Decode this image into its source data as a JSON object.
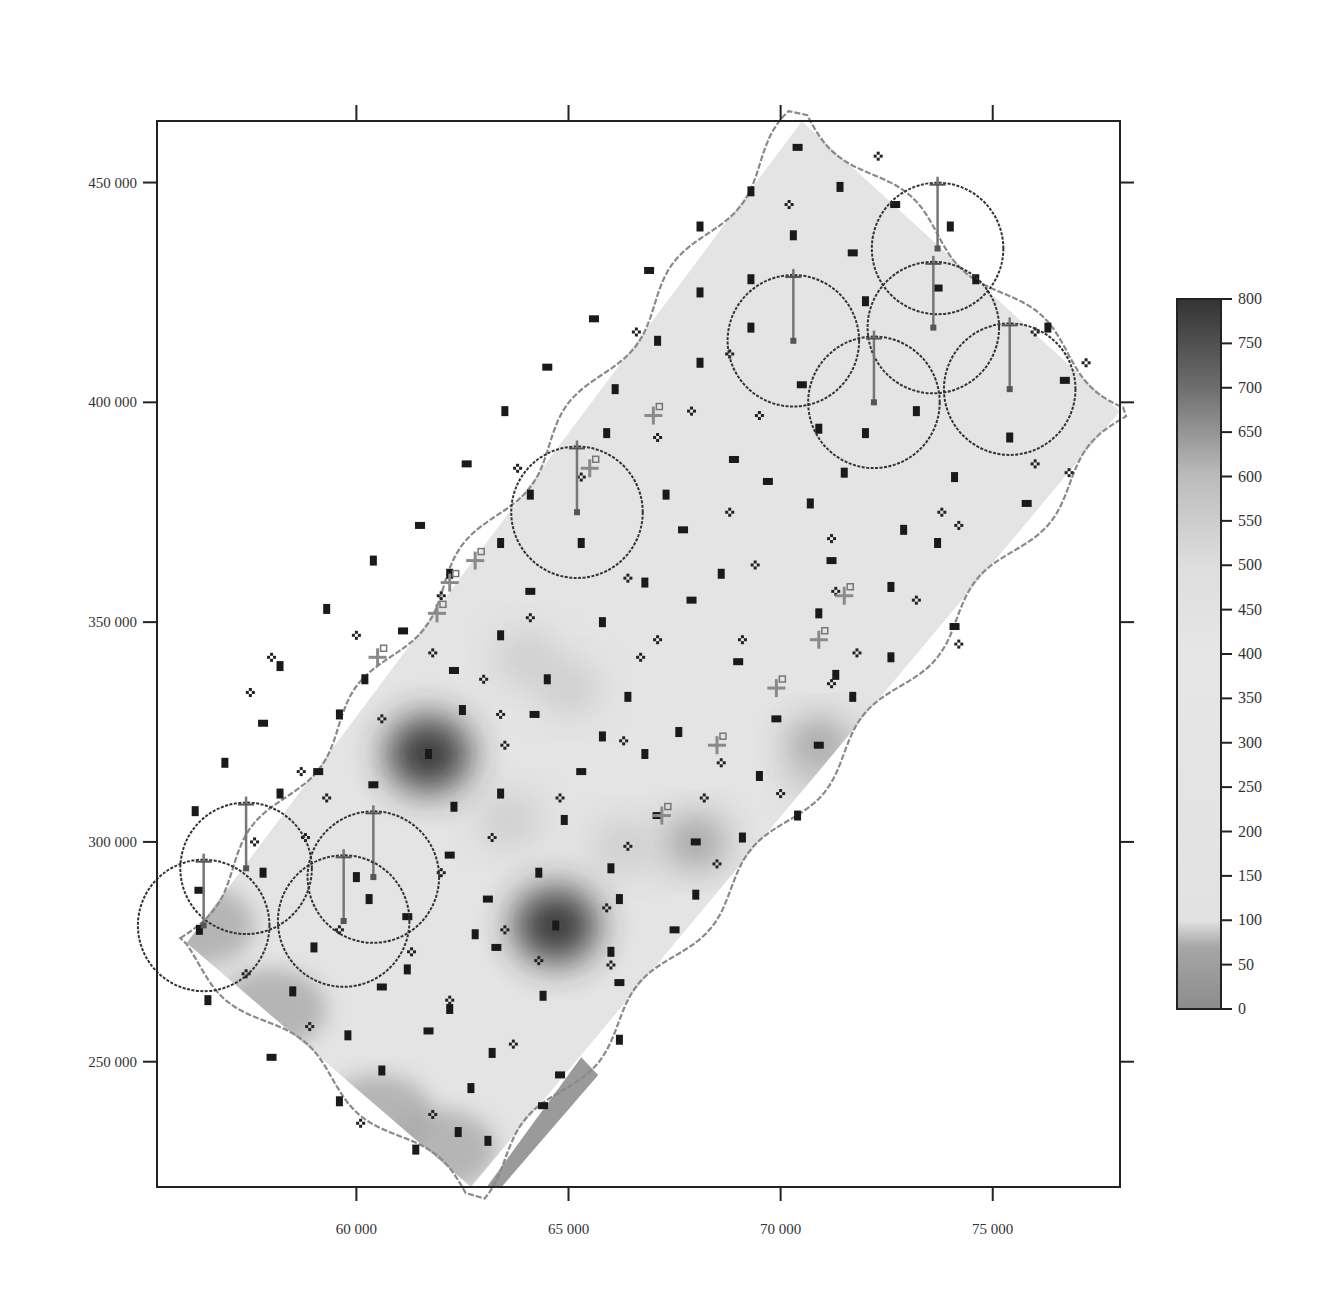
{
  "chart_data": {
    "type": "heatmap",
    "title": "",
    "xlabel": "",
    "ylabel": "",
    "xlim": [
      55300,
      78000
    ],
    "ylim": [
      221500,
      464000
    ],
    "x_ticks": [
      {
        "value": 60000,
        "label": "60 000"
      },
      {
        "value": 65000,
        "label": "65 000"
      },
      {
        "value": 70000,
        "label": "70 000"
      },
      {
        "value": 75000,
        "label": "75 000"
      }
    ],
    "y_ticks": [
      {
        "value": 450000,
        "label": "450 000"
      },
      {
        "value": 400000,
        "label": "400 000"
      },
      {
        "value": 350000,
        "label": "350 000"
      },
      {
        "value": 300000,
        "label": "300 000"
      },
      {
        "value": 250000,
        "label": "250 000"
      }
    ],
    "grid": false,
    "colorbar": {
      "placement": "right",
      "range": [
        0,
        800
      ],
      "ticks": [
        {
          "value": 800,
          "label": "800"
        },
        {
          "value": 750,
          "label": "750"
        },
        {
          "value": 700,
          "label": "700"
        },
        {
          "value": 650,
          "label": "650"
        },
        {
          "value": 600,
          "label": "600"
        },
        {
          "value": 550,
          "label": "550"
        },
        {
          "value": 500,
          "label": "500"
        },
        {
          "value": 450,
          "label": "450"
        },
        {
          "value": 400,
          "label": "400"
        },
        {
          "value": 350,
          "label": "350"
        },
        {
          "value": 300,
          "label": "300"
        },
        {
          "value": 250,
          "label": "250"
        },
        {
          "value": 200,
          "label": "200"
        },
        {
          "value": 150,
          "label": "150"
        },
        {
          "value": 100,
          "label": "100"
        },
        {
          "value": 50,
          "label": "50"
        },
        {
          "value": 0,
          "label": "0"
        }
      ],
      "stops": [
        {
          "value": 0,
          "color": "#8c8c8c"
        },
        {
          "value": 70,
          "color": "#a6a6a6"
        },
        {
          "value": 100,
          "color": "#e2e2e2"
        },
        {
          "value": 400,
          "color": "#e6e6e6"
        },
        {
          "value": 500,
          "color": "#dedede"
        },
        {
          "value": 600,
          "color": "#bcbcbc"
        },
        {
          "value": 700,
          "color": "#6e6e6e"
        },
        {
          "value": 800,
          "color": "#333333"
        }
      ]
    },
    "field": {
      "base_value": 300,
      "region_corners": [
        [
          56000,
          277000
        ],
        [
          70500,
          464000
        ],
        [
          78000,
          398000
        ],
        [
          62700,
          221500
        ]
      ],
      "hotspots": [
        {
          "x": 61700,
          "y": 320000,
          "value": 780
        },
        {
          "x": 64700,
          "y": 281000,
          "value": 720
        },
        {
          "x": 68000,
          "y": 300000,
          "value": 640
        },
        {
          "x": 70900,
          "y": 322000,
          "value": 660
        },
        {
          "x": 66300,
          "y": 299000,
          "value": 560
        },
        {
          "x": 63600,
          "y": 305000,
          "value": 560
        },
        {
          "x": 64000,
          "y": 342000,
          "value": 560
        },
        {
          "x": 65000,
          "y": 335000,
          "value": 540
        },
        {
          "x": 71000,
          "y": 315000,
          "value": 600
        }
      ],
      "lows": [
        {
          "x": 56300,
          "y": 281000,
          "value": 40
        },
        {
          "x": 58000,
          "y": 262000,
          "value": 60
        },
        {
          "x": 60500,
          "y": 238000,
          "value": 50
        },
        {
          "x": 62000,
          "y": 230000,
          "value": 40
        }
      ]
    },
    "sample_points": [
      {
        "x": 70400,
        "y": 458000
      },
      {
        "x": 71400,
        "y": 449000
      },
      {
        "x": 69300,
        "y": 448000
      },
      {
        "x": 72700,
        "y": 445000
      },
      {
        "x": 68100,
        "y": 440000
      },
      {
        "x": 70300,
        "y": 438000
      },
      {
        "x": 66900,
        "y": 430000
      },
      {
        "x": 68100,
        "y": 425000
      },
      {
        "x": 69300,
        "y": 428000
      },
      {
        "x": 71700,
        "y": 434000
      },
      {
        "x": 74000,
        "y": 440000
      },
      {
        "x": 72000,
        "y": 423000
      },
      {
        "x": 65600,
        "y": 419000
      },
      {
        "x": 67100,
        "y": 414000
      },
      {
        "x": 69300,
        "y": 417000
      },
      {
        "x": 73700,
        "y": 426000
      },
      {
        "x": 74600,
        "y": 428000
      },
      {
        "x": 76300,
        "y": 417000
      },
      {
        "x": 64500,
        "y": 408000
      },
      {
        "x": 66100,
        "y": 403000
      },
      {
        "x": 68100,
        "y": 409000
      },
      {
        "x": 70500,
        "y": 404000
      },
      {
        "x": 72000,
        "y": 393000
      },
      {
        "x": 73200,
        "y": 398000
      },
      {
        "x": 76700,
        "y": 405000
      },
      {
        "x": 63500,
        "y": 398000
      },
      {
        "x": 65900,
        "y": 393000
      },
      {
        "x": 68900,
        "y": 387000
      },
      {
        "x": 70900,
        "y": 394000
      },
      {
        "x": 75400,
        "y": 392000
      },
      {
        "x": 62600,
        "y": 386000
      },
      {
        "x": 64100,
        "y": 379000
      },
      {
        "x": 67300,
        "y": 379000
      },
      {
        "x": 69700,
        "y": 382000
      },
      {
        "x": 71500,
        "y": 384000
      },
      {
        "x": 74100,
        "y": 383000
      },
      {
        "x": 61500,
        "y": 372000
      },
      {
        "x": 63400,
        "y": 368000
      },
      {
        "x": 65300,
        "y": 368000
      },
      {
        "x": 67700,
        "y": 371000
      },
      {
        "x": 70700,
        "y": 377000
      },
      {
        "x": 72900,
        "y": 371000
      },
      {
        "x": 75800,
        "y": 377000
      },
      {
        "x": 60400,
        "y": 364000
      },
      {
        "x": 62200,
        "y": 361000
      },
      {
        "x": 64100,
        "y": 357000
      },
      {
        "x": 66800,
        "y": 359000
      },
      {
        "x": 68600,
        "y": 361000
      },
      {
        "x": 71200,
        "y": 364000
      },
      {
        "x": 73700,
        "y": 368000
      },
      {
        "x": 59300,
        "y": 353000
      },
      {
        "x": 61100,
        "y": 348000
      },
      {
        "x": 63400,
        "y": 347000
      },
      {
        "x": 65800,
        "y": 350000
      },
      {
        "x": 67900,
        "y": 355000
      },
      {
        "x": 70900,
        "y": 352000
      },
      {
        "x": 72600,
        "y": 358000
      },
      {
        "x": 74100,
        "y": 349000
      },
      {
        "x": 58200,
        "y": 340000
      },
      {
        "x": 60200,
        "y": 337000
      },
      {
        "x": 62300,
        "y": 339000
      },
      {
        "x": 64500,
        "y": 337000
      },
      {
        "x": 66400,
        "y": 333000
      },
      {
        "x": 69000,
        "y": 341000
      },
      {
        "x": 71300,
        "y": 338000
      },
      {
        "x": 72600,
        "y": 342000
      },
      {
        "x": 57800,
        "y": 327000
      },
      {
        "x": 59600,
        "y": 329000
      },
      {
        "x": 62500,
        "y": 330000
      },
      {
        "x": 64200,
        "y": 329000
      },
      {
        "x": 65800,
        "y": 324000
      },
      {
        "x": 67600,
        "y": 325000
      },
      {
        "x": 69900,
        "y": 328000
      },
      {
        "x": 71700,
        "y": 333000
      },
      {
        "x": 56900,
        "y": 318000
      },
      {
        "x": 59100,
        "y": 316000
      },
      {
        "x": 61700,
        "y": 320000
      },
      {
        "x": 63400,
        "y": 311000
      },
      {
        "x": 65300,
        "y": 316000
      },
      {
        "x": 66800,
        "y": 320000
      },
      {
        "x": 69500,
        "y": 315000
      },
      {
        "x": 70900,
        "y": 322000
      },
      {
        "x": 56200,
        "y": 307000
      },
      {
        "x": 58200,
        "y": 311000
      },
      {
        "x": 60400,
        "y": 313000
      },
      {
        "x": 62300,
        "y": 308000
      },
      {
        "x": 64900,
        "y": 305000
      },
      {
        "x": 67100,
        "y": 306000
      },
      {
        "x": 69100,
        "y": 301000
      },
      {
        "x": 70400,
        "y": 306000
      },
      {
        "x": 62200,
        "y": 297000
      },
      {
        "x": 64300,
        "y": 293000
      },
      {
        "x": 66000,
        "y": 294000
      },
      {
        "x": 68000,
        "y": 300000
      },
      {
        "x": 57800,
        "y": 293000
      },
      {
        "x": 60000,
        "y": 292000
      },
      {
        "x": 63100,
        "y": 287000
      },
      {
        "x": 66200,
        "y": 287000
      },
      {
        "x": 68000,
        "y": 288000
      },
      {
        "x": 61200,
        "y": 283000
      },
      {
        "x": 62800,
        "y": 279000
      },
      {
        "x": 64700,
        "y": 281000
      },
      {
        "x": 67500,
        "y": 280000
      },
      {
        "x": 59000,
        "y": 276000
      },
      {
        "x": 61200,
        "y": 271000
      },
      {
        "x": 63300,
        "y": 276000
      },
      {
        "x": 66000,
        "y": 275000
      },
      {
        "x": 58500,
        "y": 266000
      },
      {
        "x": 60600,
        "y": 267000
      },
      {
        "x": 62200,
        "y": 262000
      },
      {
        "x": 64400,
        "y": 265000
      },
      {
        "x": 66200,
        "y": 268000
      },
      {
        "x": 56500,
        "y": 264000
      },
      {
        "x": 59800,
        "y": 256000
      },
      {
        "x": 61700,
        "y": 257000
      },
      {
        "x": 63200,
        "y": 252000
      },
      {
        "x": 66200,
        "y": 255000
      },
      {
        "x": 58000,
        "y": 251000
      },
      {
        "x": 60600,
        "y": 248000
      },
      {
        "x": 62700,
        "y": 244000
      },
      {
        "x": 64800,
        "y": 247000
      },
      {
        "x": 59600,
        "y": 241000
      },
      {
        "x": 62400,
        "y": 234000
      },
      {
        "x": 64400,
        "y": 240000
      },
      {
        "x": 63100,
        "y": 232000
      },
      {
        "x": 61400,
        "y": 230000
      },
      {
        "x": 56300,
        "y": 289000
      },
      {
        "x": 56300,
        "y": 280000
      },
      {
        "x": 60300,
        "y": 287000
      }
    ],
    "diamond_markers": [
      {
        "x": 72300,
        "y": 456000
      },
      {
        "x": 70200,
        "y": 445000
      },
      {
        "x": 66600,
        "y": 416000
      },
      {
        "x": 68800,
        "y": 411000
      },
      {
        "x": 76000,
        "y": 416000
      },
      {
        "x": 77200,
        "y": 409000
      },
      {
        "x": 67900,
        "y": 398000
      },
      {
        "x": 69500,
        "y": 397000
      },
      {
        "x": 76000,
        "y": 386000
      },
      {
        "x": 74200,
        "y": 372000
      },
      {
        "x": 76800,
        "y": 384000
      },
      {
        "x": 67100,
        "y": 392000
      },
      {
        "x": 63800,
        "y": 385000
      },
      {
        "x": 68800,
        "y": 375000
      },
      {
        "x": 71200,
        "y": 369000
      },
      {
        "x": 73800,
        "y": 375000
      },
      {
        "x": 65300,
        "y": 383000
      },
      {
        "x": 66400,
        "y": 360000
      },
      {
        "x": 69400,
        "y": 363000
      },
      {
        "x": 71300,
        "y": 357000
      },
      {
        "x": 73200,
        "y": 355000
      },
      {
        "x": 62000,
        "y": 356000
      },
      {
        "x": 64100,
        "y": 351000
      },
      {
        "x": 67100,
        "y": 346000
      },
      {
        "x": 69100,
        "y": 346000
      },
      {
        "x": 71800,
        "y": 343000
      },
      {
        "x": 74200,
        "y": 345000
      },
      {
        "x": 60000,
        "y": 347000
      },
      {
        "x": 61800,
        "y": 343000
      },
      {
        "x": 63000,
        "y": 337000
      },
      {
        "x": 66700,
        "y": 342000
      },
      {
        "x": 71200,
        "y": 336000
      },
      {
        "x": 58000,
        "y": 342000
      },
      {
        "x": 63400,
        "y": 329000
      },
      {
        "x": 66300,
        "y": 323000
      },
      {
        "x": 68600,
        "y": 318000
      },
      {
        "x": 57500,
        "y": 334000
      },
      {
        "x": 60600,
        "y": 328000
      },
      {
        "x": 58700,
        "y": 316000
      },
      {
        "x": 63500,
        "y": 322000
      },
      {
        "x": 59300,
        "y": 310000
      },
      {
        "x": 58800,
        "y": 301000
      },
      {
        "x": 66400,
        "y": 299000
      },
      {
        "x": 68200,
        "y": 310000
      },
      {
        "x": 70000,
        "y": 311000
      },
      {
        "x": 57600,
        "y": 300000
      },
      {
        "x": 64800,
        "y": 310000
      },
      {
        "x": 63200,
        "y": 301000
      },
      {
        "x": 62000,
        "y": 293000
      },
      {
        "x": 68500,
        "y": 295000
      },
      {
        "x": 65900,
        "y": 285000
      },
      {
        "x": 63500,
        "y": 280000
      },
      {
        "x": 59600,
        "y": 280000
      },
      {
        "x": 57400,
        "y": 270000
      },
      {
        "x": 61300,
        "y": 275000
      },
      {
        "x": 64300,
        "y": 273000
      },
      {
        "x": 66000,
        "y": 272000
      },
      {
        "x": 58900,
        "y": 258000
      },
      {
        "x": 62200,
        "y": 264000
      },
      {
        "x": 63700,
        "y": 254000
      },
      {
        "x": 60100,
        "y": 236000
      },
      {
        "x": 61800,
        "y": 238000
      }
    ],
    "circles": [
      {
        "cx": 73700,
        "cy": 435000,
        "r_km": 1.55
      },
      {
        "cx": 73600,
        "cy": 417000,
        "r_km": 1.55
      },
      {
        "cx": 70300,
        "cy": 414000,
        "r_km": 1.55
      },
      {
        "cx": 72200,
        "cy": 400000,
        "r_km": 1.55
      },
      {
        "cx": 75400,
        "cy": 403000,
        "r_km": 1.55
      },
      {
        "cx": 65200,
        "cy": 375000,
        "r_km": 1.55
      },
      {
        "cx": 57400,
        "cy": 294000,
        "r_km": 1.55
      },
      {
        "cx": 60400,
        "cy": 292000,
        "r_km": 1.55
      },
      {
        "cx": 59700,
        "cy": 282000,
        "r_km": 1.55
      },
      {
        "cx": 56400,
        "cy": 281000,
        "r_km": 1.55
      }
    ],
    "cross_markers": [
      {
        "x": 67000,
        "y": 397000
      },
      {
        "x": 65500,
        "y": 385000
      },
      {
        "x": 62800,
        "y": 364000
      },
      {
        "x": 62200,
        "y": 359000
      },
      {
        "x": 61900,
        "y": 352000
      },
      {
        "x": 60500,
        "y": 342000
      },
      {
        "x": 71500,
        "y": 356000
      },
      {
        "x": 70900,
        "y": 346000
      },
      {
        "x": 69900,
        "y": 335000
      },
      {
        "x": 68500,
        "y": 322000
      },
      {
        "x": 67200,
        "y": 306000
      }
    ]
  }
}
